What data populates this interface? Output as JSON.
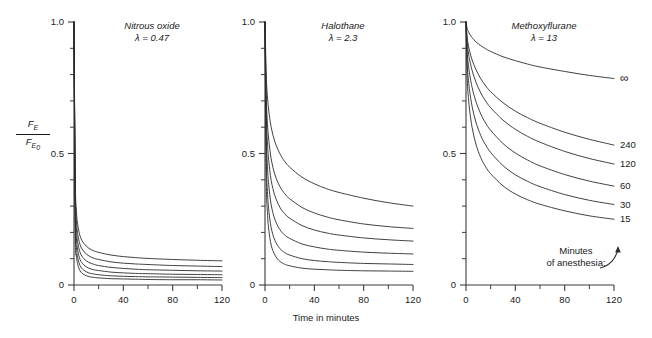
{
  "figure": {
    "y_axis_title_numerator": "F",
    "y_axis_title_numerator_sub": "E",
    "y_axis_title_denominator": "F",
    "y_axis_title_denominator_sub": "E",
    "y_axis_title_denominator_sub2": "0",
    "x_axis_title": "Time in minutes",
    "note_line1": "Minutes",
    "note_line2": "of anesthesia:"
  },
  "chart_data": {
    "type": "line",
    "xlabel": "Time in minutes",
    "ylabel": "FE / FE0",
    "xlim": [
      0,
      120
    ],
    "ylim": [
      0,
      1.0
    ],
    "xticks": [
      0,
      20,
      40,
      60,
      80,
      100,
      120
    ],
    "xtick_labels": [
      "0",
      "",
      "40",
      "",
      "80",
      "",
      "120"
    ],
    "yticks": [
      0,
      0.1,
      0.2,
      0.3,
      0.4,
      0.5,
      0.6,
      0.7,
      0.8,
      0.9,
      1.0
    ],
    "ytick_labels": [
      "0",
      "",
      "",
      "",
      "",
      "0.5",
      "",
      "",
      "",
      "",
      "1.0"
    ],
    "grid": false,
    "legend": "inline curve end labels on third panel",
    "duration_labels": [
      "∞",
      "240",
      "120",
      "60",
      "30",
      "15"
    ],
    "panels": [
      {
        "name": "Nitrous oxide",
        "title": "Nitrous oxide",
        "lambda_label": "λ = 0.47",
        "lambda": 0.47,
        "x": [
          0,
          1,
          2,
          3,
          5,
          8,
          12,
          16,
          20,
          30,
          40,
          50,
          60,
          80,
          100,
          120
        ],
        "series": [
          {
            "name": "∞",
            "values": [
              1.0,
              0.41,
              0.28,
              0.23,
              0.185,
              0.158,
              0.14,
              0.13,
              0.124,
              0.114,
              0.108,
              0.104,
              0.101,
              0.097,
              0.094,
              0.092
            ]
          },
          {
            "name": "240",
            "values": [
              1.0,
              0.37,
              0.245,
              0.195,
              0.152,
              0.127,
              0.111,
              0.102,
              0.097,
              0.088,
              0.083,
              0.08,
              0.078,
              0.074,
              0.072,
              0.07
            ]
          },
          {
            "name": "120",
            "values": [
              1.0,
              0.33,
              0.21,
              0.163,
              0.123,
              0.1,
              0.086,
              0.079,
              0.074,
              0.067,
              0.063,
              0.06,
              0.058,
              0.056,
              0.054,
              0.053
            ]
          },
          {
            "name": "60",
            "values": [
              1.0,
              0.29,
              0.175,
              0.132,
              0.096,
              0.076,
              0.064,
              0.058,
              0.055,
              0.049,
              0.046,
              0.044,
              0.043,
              0.041,
              0.04,
              0.039
            ]
          },
          {
            "name": "30",
            "values": [
              1.0,
              0.25,
              0.142,
              0.104,
              0.073,
              0.056,
              0.046,
              0.042,
              0.039,
              0.035,
              0.033,
              0.032,
              0.031,
              0.03,
              0.029,
              0.028
            ]
          },
          {
            "name": "15",
            "values": [
              1.0,
              0.21,
              0.112,
              0.079,
              0.053,
              0.04,
              0.032,
              0.029,
              0.027,
              0.024,
              0.023,
              0.022,
              0.021,
              0.02,
              0.02,
              0.019
            ]
          }
        ]
      },
      {
        "name": "Halothane",
        "title": "Halothane",
        "lambda_label": "λ = 2.3",
        "lambda": 2.3,
        "x": [
          0,
          1,
          2,
          3,
          5,
          8,
          12,
          16,
          20,
          30,
          40,
          50,
          60,
          80,
          100,
          120
        ],
        "series": [
          {
            "name": "∞",
            "values": [
              1.0,
              0.8,
              0.715,
              0.665,
              0.6,
              0.545,
              0.5,
              0.47,
              0.448,
              0.41,
              0.385,
              0.366,
              0.352,
              0.33,
              0.313,
              0.3
            ]
          },
          {
            "name": "240",
            "values": [
              1.0,
              0.72,
              0.615,
              0.555,
              0.48,
              0.42,
              0.375,
              0.347,
              0.328,
              0.295,
              0.274,
              0.259,
              0.248,
              0.232,
              0.222,
              0.215
            ]
          },
          {
            "name": "120",
            "values": [
              1.0,
              0.66,
              0.54,
              0.475,
              0.398,
              0.34,
              0.296,
              0.271,
              0.254,
              0.226,
              0.209,
              0.198,
              0.19,
              0.179,
              0.172,
              0.167
            ]
          },
          {
            "name": "60",
            "values": [
              1.0,
              0.58,
              0.45,
              0.382,
              0.305,
              0.25,
              0.211,
              0.19,
              0.177,
              0.156,
              0.145,
              0.137,
              0.132,
              0.125,
              0.121,
              0.118
            ]
          },
          {
            "name": "30",
            "values": [
              1.0,
              0.49,
              0.355,
              0.288,
              0.218,
              0.17,
              0.139,
              0.123,
              0.114,
              0.1,
              0.093,
              0.089,
              0.086,
              0.082,
              0.08,
              0.078
            ]
          },
          {
            "name": "15",
            "values": [
              1.0,
              0.41,
              0.275,
              0.213,
              0.152,
              0.114,
              0.09,
              0.079,
              0.073,
              0.064,
              0.06,
              0.058,
              0.056,
              0.054,
              0.053,
              0.052
            ]
          }
        ]
      },
      {
        "name": "Methoxyflurane",
        "title": "Methoxyflurane",
        "lambda_label": "λ = 13",
        "lambda": 13,
        "x": [
          0,
          1,
          2,
          3,
          5,
          8,
          12,
          16,
          20,
          30,
          40,
          50,
          60,
          80,
          100,
          120
        ],
        "series": [
          {
            "name": "∞",
            "values": [
              1.0,
              0.975,
              0.963,
              0.954,
              0.94,
              0.925,
              0.91,
              0.898,
              0.888,
              0.868,
              0.853,
              0.84,
              0.829,
              0.812,
              0.797,
              0.785
            ]
          },
          {
            "name": "240",
            "values": [
              1.0,
              0.94,
              0.91,
              0.888,
              0.855,
              0.82,
              0.784,
              0.757,
              0.735,
              0.693,
              0.661,
              0.636,
              0.615,
              0.581,
              0.554,
              0.532
            ]
          },
          {
            "name": "120",
            "values": [
              1.0,
              0.92,
              0.882,
              0.855,
              0.815,
              0.772,
              0.73,
              0.699,
              0.674,
              0.627,
              0.592,
              0.565,
              0.543,
              0.508,
              0.481,
              0.46
            ]
          },
          {
            "name": "60",
            "values": [
              1.0,
              0.885,
              0.835,
              0.8,
              0.75,
              0.698,
              0.65,
              0.615,
              0.588,
              0.538,
              0.502,
              0.475,
              0.453,
              0.42,
              0.395,
              0.376
            ]
          },
          {
            "name": "30",
            "values": [
              1.0,
              0.84,
              0.778,
              0.736,
              0.678,
              0.62,
              0.568,
              0.532,
              0.504,
              0.454,
              0.419,
              0.394,
              0.374,
              0.344,
              0.322,
              0.306
            ]
          },
          {
            "name": "15",
            "values": [
              1.0,
              0.785,
              0.71,
              0.662,
              0.598,
              0.536,
              0.484,
              0.449,
              0.423,
              0.377,
              0.346,
              0.324,
              0.307,
              0.282,
              0.263,
              0.25
            ]
          }
        ]
      }
    ]
  }
}
